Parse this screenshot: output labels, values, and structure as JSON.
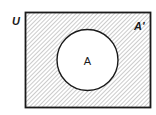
{
  "diagram": {
    "type": "venn",
    "universe_label": "U",
    "set_label": "A",
    "complement_label": "A'",
    "shaded_region": "complement of A",
    "colors": {
      "stroke": "#1a1a1a",
      "hatch": "#9a9a9a",
      "background": "#ffffff"
    }
  }
}
